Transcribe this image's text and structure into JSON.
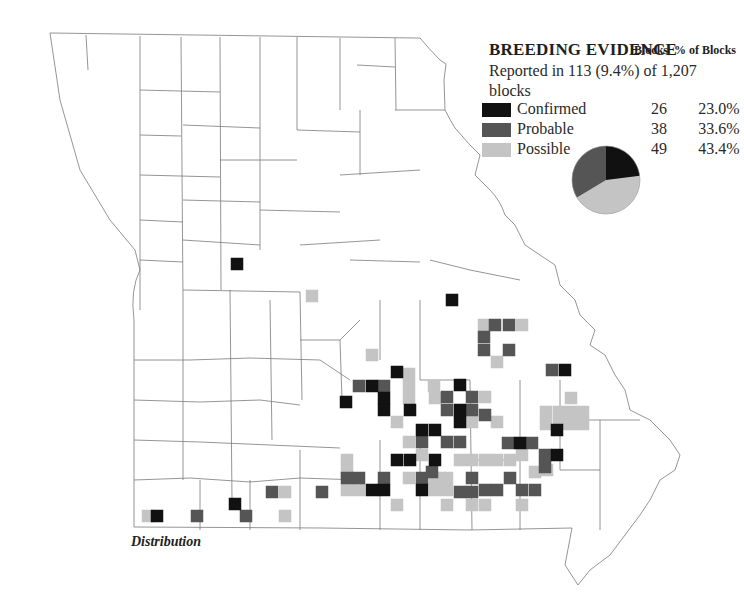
{
  "legend": {
    "title": "BREEDING EVIDENCE",
    "subtitle": "Reported in 113 (9.4%) of 1,207 blocks",
    "col_blocks": "Blocks",
    "col_pct": "% of Blocks",
    "rows": [
      {
        "label": "Confirmed",
        "blocks": "26",
        "pct": "23.0%",
        "color": "#111111"
      },
      {
        "label": "Probable",
        "blocks": "38",
        "pct": "33.6%",
        "color": "#555555"
      },
      {
        "label": "Possible",
        "blocks": "49",
        "pct": "43.4%",
        "color": "#c4c4c4"
      }
    ]
  },
  "caption": "Distribution",
  "chart_data": {
    "type": "pie",
    "title": "BREEDING EVIDENCE",
    "subtitle": "Reported in 113 (9.4%) of 1,207 blocks",
    "categories": [
      "Confirmed",
      "Probable",
      "Possible"
    ],
    "values": [
      26,
      38,
      49
    ],
    "percent": [
      23.0,
      33.6,
      43.4
    ],
    "colors": [
      "#111111",
      "#555555",
      "#c4c4c4"
    ],
    "map": {
      "region": "Missouri counties",
      "cell_size_px": 12.5,
      "confirmed_cells": [
        [
          237,
          264
        ],
        [
          452,
          300
        ],
        [
          565,
          370
        ],
        [
          397,
          372
        ],
        [
          460,
          385
        ],
        [
          346,
          402
        ],
        [
          372,
          386
        ],
        [
          384,
          398
        ],
        [
          384,
          410
        ],
        [
          410,
          410
        ],
        [
          422,
          430
        ],
        [
          435,
          430
        ],
        [
          460,
          410
        ],
        [
          460,
          422
        ],
        [
          520,
          443
        ],
        [
          557,
          430
        ],
        [
          557,
          455
        ],
        [
          410,
          460
        ],
        [
          372,
          490
        ],
        [
          384,
          490
        ],
        [
          422,
          490
        ],
        [
          397,
          460
        ],
        [
          435,
          460
        ],
        [
          157,
          516
        ],
        [
          235,
          504
        ]
      ],
      "probable_cells": [
        [
          484,
          337
        ],
        [
          484,
          350
        ],
        [
          495,
          325
        ],
        [
          509,
          325
        ],
        [
          509,
          350
        ],
        [
          552,
          370
        ],
        [
          359,
          386
        ],
        [
          384,
          386
        ],
        [
          447,
          397
        ],
        [
          472,
          397
        ],
        [
          447,
          410
        ],
        [
          472,
          410
        ],
        [
          485,
          415
        ],
        [
          422,
          442
        ],
        [
          447,
          442
        ],
        [
          460,
          442
        ],
        [
          508,
          443
        ],
        [
          532,
          443
        ],
        [
          545,
          455
        ],
        [
          545,
          467
        ],
        [
          432,
          472
        ],
        [
          359,
          478
        ],
        [
          384,
          478
        ],
        [
          347,
          478
        ],
        [
          422,
          478
        ],
        [
          472,
          478
        ],
        [
          485,
          490
        ],
        [
          497,
          490
        ],
        [
          510,
          478
        ],
        [
          522,
          490
        ],
        [
          535,
          490
        ],
        [
          272,
          492
        ],
        [
          322,
          492
        ],
        [
          197,
          516
        ],
        [
          246,
          516
        ],
        [
          460,
          492
        ],
        [
          472,
          492
        ]
      ],
      "possible_cells": [
        [
          484,
          325
        ],
        [
          522,
          325
        ],
        [
          497,
          362
        ],
        [
          372,
          355
        ],
        [
          312,
          296
        ],
        [
          409,
          374
        ],
        [
          409,
          386
        ],
        [
          409,
          398
        ],
        [
          434,
          386
        ],
        [
          397,
          422
        ],
        [
          435,
          398
        ],
        [
          472,
          422
        ],
        [
          485,
          397
        ],
        [
          571,
          398
        ],
        [
          546,
          412
        ],
        [
          559,
          412
        ],
        [
          571,
          412
        ],
        [
          583,
          412
        ],
        [
          546,
          424
        ],
        [
          559,
          424
        ],
        [
          571,
          424
        ],
        [
          583,
          424
        ],
        [
          497,
          422
        ],
        [
          522,
          455
        ],
        [
          547,
          470
        ],
        [
          347,
          460
        ],
        [
          347,
          472
        ],
        [
          347,
          490
        ],
        [
          359,
          490
        ],
        [
          409,
          478
        ],
        [
          435,
          478
        ],
        [
          447,
          478
        ],
        [
          460,
          460
        ],
        [
          472,
          460
        ],
        [
          485,
          460
        ],
        [
          497,
          460
        ],
        [
          510,
          460
        ],
        [
          435,
          490
        ],
        [
          447,
          490
        ],
        [
          447,
          505
        ],
        [
          472,
          505
        ],
        [
          485,
          505
        ],
        [
          397,
          505
        ],
        [
          535,
          472
        ],
        [
          522,
          505
        ],
        [
          285,
          492
        ],
        [
          285,
          516
        ],
        [
          148,
          516
        ],
        [
          409,
          442
        ],
        [
          422,
          455
        ]
      ]
    }
  }
}
